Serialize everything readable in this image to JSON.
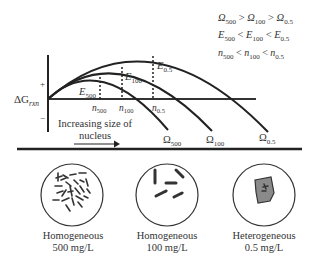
{
  "relations": {
    "omega": {
      "sym": "Ω",
      "a": "500",
      "b": "100",
      "c": "0.5",
      "op": ">"
    },
    "energy": {
      "sym": "E",
      "a": "500",
      "b": "100",
      "c": "0.5",
      "op": "<"
    },
    "size": {
      "sym": "n",
      "a": "500",
      "b": "100",
      "c": "0.5",
      "op": "<"
    }
  },
  "axis": {
    "y_label_main": "ΔG",
    "y_label_sub": "rxn",
    "plus": "+",
    "minus": "−",
    "arrow_text_line1": "Increasing size of",
    "arrow_text_line2": "nucleus"
  },
  "curves": [
    {
      "name": "Ω500",
      "sym": "Ω",
      "sub": "500",
      "energy_sub": "500",
      "n_sub": "500"
    },
    {
      "name": "Ω100",
      "sym": "Ω",
      "sub": "100",
      "energy_sub": "100",
      "n_sub": "100"
    },
    {
      "name": "Ω0.5",
      "sym": "Ω",
      "sub": "0.5",
      "energy_sub": "0.5",
      "n_sub": "0.5"
    }
  ],
  "panels": [
    {
      "type": "Homogeneous",
      "concentration": "500 mg/L"
    },
    {
      "type": "Homogeneous",
      "concentration": "100 mg/L"
    },
    {
      "type": "Heterogeneous",
      "concentration": "0.5 mg/L"
    }
  ],
  "colors": {
    "line": "#222222",
    "nucleus_fill": "#8a8a8a",
    "text": "#333333"
  }
}
